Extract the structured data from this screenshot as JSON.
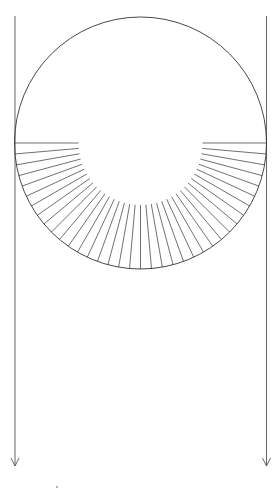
{
  "diagram": {
    "type": "fan-diagram",
    "stroke_color": "#333333",
    "arrow_color": "#555555",
    "circle": {
      "cx": 140.5,
      "cy": 143,
      "r": 126
    },
    "fan": {
      "inner_r": 62,
      "start_deg": 180,
      "end_deg": 360,
      "step_deg": 5
    },
    "arrows": [
      {
        "name": "left-down-arrow",
        "x": 15,
        "y1": 16,
        "y2": 466
      },
      {
        "name": "right-down-arrow",
        "x": 266.5,
        "y1": 16,
        "y2": 466
      }
    ],
    "marks": [
      {
        "name": "small-dot",
        "x": 57,
        "y": 487
      }
    ]
  }
}
